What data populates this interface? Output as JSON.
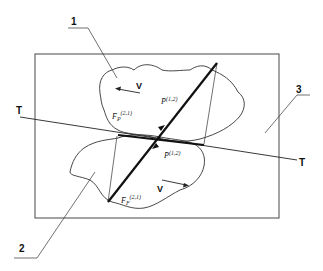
{
  "diagram": {
    "callouts": [
      {
        "id": "1",
        "label": "1"
      },
      {
        "id": "2",
        "label": "2"
      },
      {
        "id": "3",
        "label": "3"
      }
    ],
    "tangent_line": {
      "left_label": "T",
      "right_label": "T"
    },
    "velocity_labels": {
      "upper": "V",
      "lower": "V"
    },
    "force_labels": {
      "upper_normal": {
        "base": "P̄",
        "sup": "(1,2)"
      },
      "upper_friction": {
        "base": "F̄",
        "sub": "P",
        "sup": "(2,1)"
      },
      "lower_normal": {
        "base": "P̄",
        "sup": "(1,2)"
      },
      "lower_friction": {
        "base": "F̄",
        "sub": "F",
        "sup": "(2,1)"
      }
    },
    "colors": {
      "line": "#1a1a1a",
      "background": "#ffffff"
    }
  }
}
